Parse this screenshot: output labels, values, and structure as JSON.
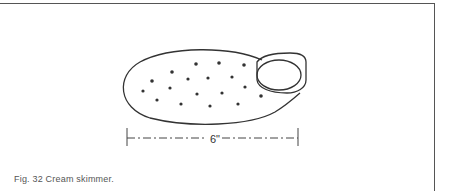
{
  "figure": {
    "number": "Fig. 32",
    "caption": "Cream skimmer.",
    "caption_full": "Fig. 32  Cream skimmer.",
    "dimension_label": "6\"",
    "illustration": "cream-skimmer-drawing",
    "line_color": "#333333"
  }
}
